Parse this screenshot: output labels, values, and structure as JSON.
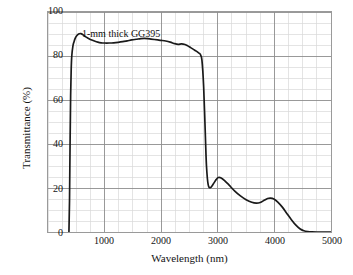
{
  "chart_data": {
    "type": "line",
    "title": "",
    "xlabel": "Wavelength (nm)",
    "ylabel": "Transmittance (%)",
    "xlim": [
      0,
      5000
    ],
    "ylim": [
      0,
      100
    ],
    "xticks": [
      1000,
      2000,
      3000,
      4000,
      5000
    ],
    "xtick_labels": [
      "1000",
      "2000",
      "3000",
      "4000",
      "5000"
    ],
    "yticks": [
      0,
      20,
      40,
      60,
      80,
      100
    ],
    "ytick_labels": [
      "0",
      "20",
      "40",
      "60",
      "80",
      "100"
    ],
    "x_minor_step": 250,
    "y_minor_step": 5,
    "grid": true,
    "legend": null,
    "annotations": [
      {
        "text": "1-mm thick GG395",
        "x": 1180,
        "y": 93
      }
    ],
    "series": [
      {
        "name": "1-mm thick GG395",
        "color": "#1a1a1a",
        "x": [
          370,
          380,
          390,
          400,
          410,
          420,
          440,
          460,
          480,
          500,
          540,
          580,
          620,
          660,
          700,
          760,
          820,
          880,
          940,
          1000,
          1080,
          1160,
          1240,
          1320,
          1400,
          1480,
          1560,
          1640,
          1700,
          1760,
          1820,
          1880,
          1940,
          2000,
          2080,
          2160,
          2240,
          2300,
          2360,
          2420,
          2470,
          2520,
          2570,
          2620,
          2660,
          2690,
          2720,
          2750,
          2780,
          2800,
          2830,
          2870,
          2920,
          2970,
          3010,
          3060,
          3120,
          3200,
          3300,
          3400,
          3500,
          3600,
          3680,
          3750,
          3820,
          3880,
          3930,
          3990,
          4060,
          4140,
          4220,
          4300,
          4380,
          4450,
          4520,
          4590,
          4660,
          4750,
          4850,
          5000
        ],
        "y": [
          0,
          14,
          40,
          62,
          74,
          80,
          84.5,
          86.5,
          88,
          89,
          90,
          90.2,
          89.6,
          88.8,
          88.2,
          87.4,
          86.8,
          86.3,
          86.0,
          85.9,
          85.9,
          86.0,
          86.2,
          86.5,
          86.9,
          87.3,
          87.6,
          87.9,
          88.0,
          87.9,
          87.7,
          87.5,
          87.3,
          87.1,
          86.8,
          86.3,
          85.6,
          85.3,
          85.5,
          85.2,
          84.6,
          83.8,
          83.0,
          82.2,
          81.4,
          80.8,
          78.0,
          66.0,
          44.0,
          30.0,
          21.5,
          20.2,
          21.8,
          23.8,
          24.8,
          24.6,
          23.4,
          21.3,
          18.6,
          16.4,
          14.7,
          13.5,
          13.1,
          13.4,
          14.4,
          15.2,
          15.4,
          15.0,
          13.6,
          11.3,
          8.4,
          5.6,
          3.1,
          1.5,
          0.6,
          0.2,
          0.05,
          0.0,
          0.0,
          0.0
        ]
      }
    ],
    "colors": {
      "curve": "#1a1a1a",
      "frame": "#9a9a9a",
      "major_grid": "#8d8d8d",
      "minor_grid": "#d8d8d8",
      "background": "#ffffff",
      "text": "#141414"
    }
  }
}
